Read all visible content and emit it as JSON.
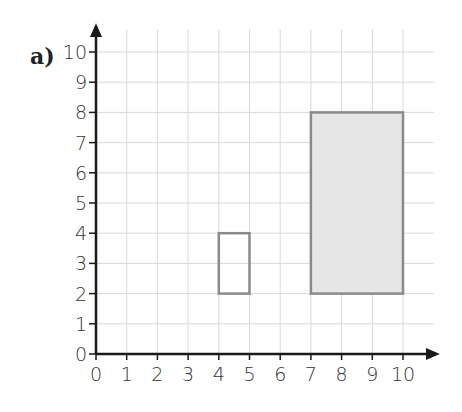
{
  "part_label": "a)",
  "chart_data": {
    "type": "grid-shapes",
    "title": "",
    "xlabel": "",
    "ylabel": "",
    "xlim": [
      0,
      10
    ],
    "ylim": [
      0,
      10
    ],
    "grid": true,
    "x_ticks": [
      "0",
      "1",
      "2",
      "3",
      "4",
      "5",
      "6",
      "7",
      "8",
      "9",
      "10"
    ],
    "y_ticks": [
      "0",
      "1",
      "2",
      "3",
      "4",
      "5",
      "6",
      "7",
      "8",
      "9",
      "10"
    ],
    "shapes": [
      {
        "name": "small rectangle",
        "x0": 4,
        "y0": 2,
        "x1": 5,
        "y1": 4,
        "fill": "none",
        "stroke": "#8a8a8a"
      },
      {
        "name": "large rectangle",
        "x0": 7,
        "y0": 2,
        "x1": 10,
        "y1": 8,
        "fill": "#e6e6e6",
        "stroke": "#8a8a8a"
      }
    ]
  },
  "colors": {
    "grid": "#d9d9d9",
    "axis": "#1a1a1a",
    "shape_stroke": "#8a8a8a",
    "shape_fill": "#e6e6e6"
  }
}
